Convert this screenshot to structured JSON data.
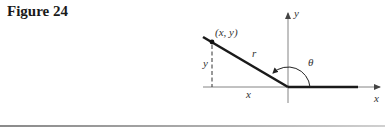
{
  "figure": {
    "title": "Figure 24"
  },
  "diagram": {
    "point_label": "(x, y)",
    "radius_label": "r",
    "vertical_leg_label": "y",
    "horizontal_leg_label": "x",
    "angle_label": "θ",
    "y_axis_label": "y",
    "x_axis_label": "x"
  },
  "colors": {
    "ink": "#1a1a1a",
    "axis": "#555555",
    "rule": "#9a9a9a"
  }
}
